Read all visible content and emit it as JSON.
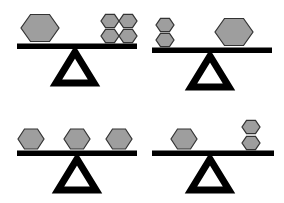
{
  "figure": {
    "background_color": "#ffffff",
    "shape_fill_color": "#9e9e9e",
    "shape_stroke_color": "#333333",
    "beam_color": "#000000",
    "fulcrum_color": "#000000",
    "panel_count": 4,
    "shape_type": "hexagon"
  },
  "panels": [
    {
      "id": "top-left",
      "name": "balance-top-left",
      "position": "top-left",
      "beam": {
        "x": 17,
        "y": 44,
        "width": 120,
        "height": 5,
        "tilt": "level"
      },
      "fulcrum": {
        "cx": 75,
        "base_y": 83,
        "width": 38,
        "height": 34
      },
      "left_pan": {
        "shape_count": 1,
        "shape_sizes": [
          "large"
        ],
        "shapes": [
          {
            "size": "large",
            "width": 38,
            "cx": 40,
            "cy": 28
          }
        ]
      },
      "right_pan": {
        "shape_count": 4,
        "shape_sizes": [
          "small",
          "small",
          "small",
          "small"
        ],
        "arrangement": "2x2-grid",
        "shapes": [
          {
            "size": "small",
            "width": 18,
            "cx": 110,
            "cy": 21
          },
          {
            "size": "small",
            "width": 18,
            "cx": 128,
            "cy": 21
          },
          {
            "size": "small",
            "width": 18,
            "cx": 110,
            "cy": 36
          },
          {
            "size": "small",
            "width": 18,
            "cx": 128,
            "cy": 36
          }
        ]
      }
    },
    {
      "id": "top-right",
      "name": "balance-top-right",
      "position": "top-right",
      "beam": {
        "x": 10,
        "y": 48,
        "width": 120,
        "height": 5,
        "tilt": "level"
      },
      "fulcrum": {
        "cx": 68,
        "base_y": 87,
        "width": 38,
        "height": 34
      },
      "left_pan": {
        "shape_count": 2,
        "shape_sizes": [
          "small",
          "small"
        ],
        "arrangement": "vertical-stack",
        "shapes": [
          {
            "size": "small",
            "width": 18,
            "cx": 23,
            "cy": 25
          },
          {
            "size": "small",
            "width": 18,
            "cx": 23,
            "cy": 40
          }
        ]
      },
      "right_pan": {
        "shape_count": 1,
        "shape_sizes": [
          "large"
        ],
        "shapes": [
          {
            "size": "large",
            "width": 38,
            "cx": 92,
            "cy": 32
          }
        ]
      }
    },
    {
      "id": "bottom-left",
      "name": "balance-bottom-left",
      "position": "bottom-left",
      "beam": {
        "x": 17,
        "y": 50,
        "width": 120,
        "height": 5,
        "tilt": "level"
      },
      "fulcrum": {
        "cx": 77,
        "base_y": 89,
        "width": 38,
        "height": 34
      },
      "left_pan": {
        "shape_count": 1,
        "shape_sizes": [
          "medium"
        ],
        "shapes": [
          {
            "size": "medium",
            "width": 26,
            "cx": 31,
            "cy": 38
          }
        ]
      },
      "right_pan": {
        "shape_count": 2,
        "shape_sizes": [
          "medium",
          "medium"
        ],
        "arrangement": "horizontal-row",
        "shapes": [
          {
            "size": "medium",
            "width": 26,
            "cx": 77,
            "cy": 38
          },
          {
            "size": "medium",
            "width": 26,
            "cx": 119,
            "cy": 38
          }
        ]
      }
    },
    {
      "id": "bottom-right",
      "name": "balance-bottom-right",
      "position": "bottom-right",
      "beam": {
        "x": 10,
        "y": 50,
        "width": 122,
        "height": 5,
        "tilt": "level"
      },
      "fulcrum": {
        "cx": 68,
        "base_y": 89,
        "width": 38,
        "height": 34
      },
      "left_pan": {
        "shape_count": 1,
        "shape_sizes": [
          "medium"
        ],
        "shapes": [
          {
            "size": "medium",
            "width": 26,
            "cx": 42,
            "cy": 38
          }
        ]
      },
      "right_pan": {
        "shape_count": 2,
        "shape_sizes": [
          "small",
          "small"
        ],
        "arrangement": "vertical-stack",
        "shapes": [
          {
            "size": "small",
            "width": 18,
            "cx": 109,
            "cy": 26
          },
          {
            "size": "small",
            "width": 18,
            "cx": 109,
            "cy": 42
          }
        ]
      }
    }
  ]
}
